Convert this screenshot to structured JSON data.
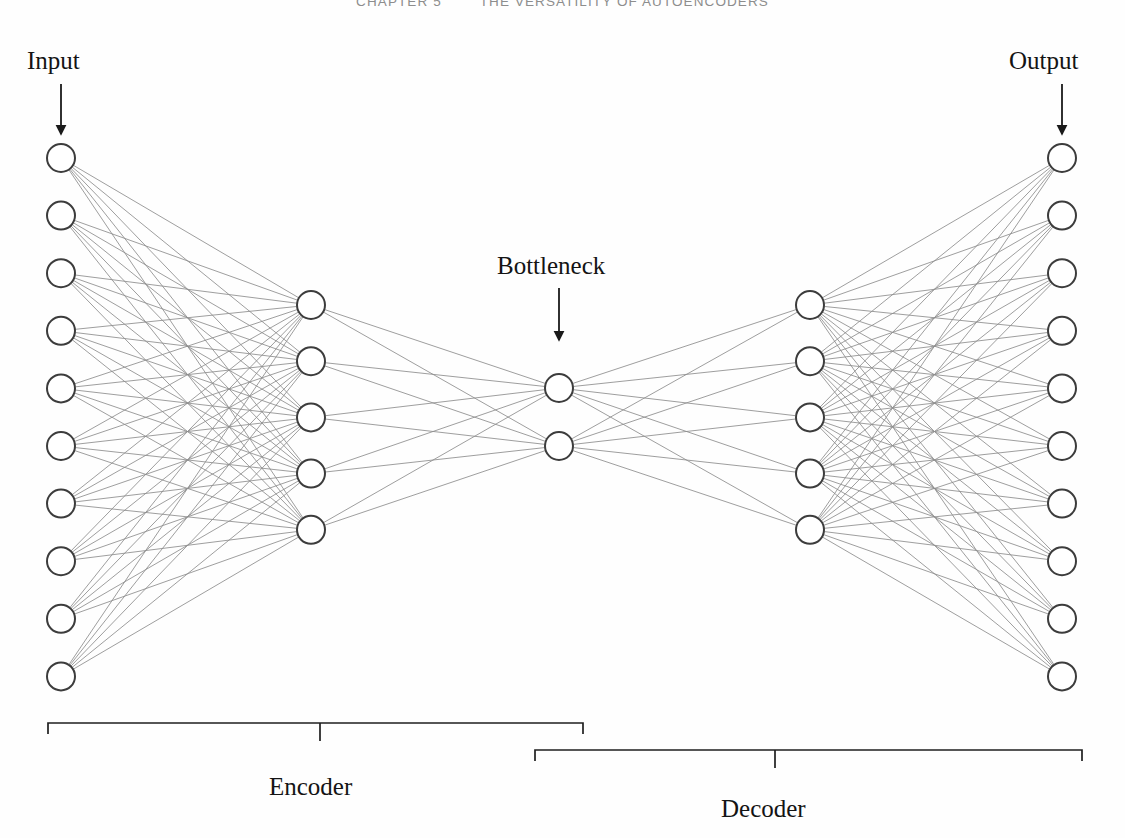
{
  "header": {
    "chapter": "CHAPTER 5",
    "title": "THE VERSATILITY OF AUTOENCODERS"
  },
  "labels": {
    "input": "Input",
    "output": "Output",
    "bottleneck": "Bottleneck",
    "encoder": "Encoder",
    "decoder": "Decoder"
  },
  "colors": {
    "node_stroke": "#3c3c3c",
    "node_fill": "#ffffff",
    "edge": "#8c8c8c",
    "text": "#141414",
    "header_text": "#8d8d8d",
    "brace": "#1f1f1f",
    "arrow": "#1a1a1a"
  },
  "diagram": {
    "type": "neural-network",
    "node_radius": 14,
    "layers": [
      {
        "name": "input-layer",
        "role": "input",
        "count": 10,
        "cx": 61,
        "y_start": 158,
        "y_spacing": 57.6
      },
      {
        "name": "encoder-hidden-layer",
        "role": "encoder",
        "count": 5,
        "cx": 311,
        "y_start": 305,
        "y_spacing": 56.2
      },
      {
        "name": "bottleneck-layer",
        "role": "bottleneck",
        "count": 2,
        "cx": 559,
        "y_start": 388,
        "y_spacing": 58
      },
      {
        "name": "decoder-hidden-layer",
        "role": "decoder",
        "count": 5,
        "cx": 810,
        "y_start": 305,
        "y_spacing": 56.2
      },
      {
        "name": "output-layer",
        "role": "output",
        "count": 10,
        "cx": 1062,
        "y_start": 158,
        "y_spacing": 57.6
      }
    ],
    "connections": [
      {
        "from": "input-layer",
        "to": "encoder-hidden-layer"
      },
      {
        "from": "encoder-hidden-layer",
        "to": "bottleneck-layer"
      },
      {
        "from": "bottleneck-layer",
        "to": "decoder-hidden-layer"
      },
      {
        "from": "decoder-hidden-layer",
        "to": "output-layer"
      }
    ],
    "arrows": [
      {
        "name": "input-arrow",
        "x": 61,
        "y_from": 84,
        "y_to": 134
      },
      {
        "name": "output-arrow",
        "x": 1062,
        "y_from": 84,
        "y_to": 134
      },
      {
        "name": "bottleneck-arrow",
        "x": 559,
        "y_from": 288,
        "y_to": 340
      }
    ],
    "braces": [
      {
        "name": "encoder-brace",
        "x_left": 48,
        "x_right": 583,
        "y": 723,
        "tick_x": 320,
        "tick_len": 18,
        "cap_len": 11
      },
      {
        "name": "decoder-brace",
        "x_left": 535,
        "x_right": 1082,
        "y": 750,
        "tick_x": 775,
        "tick_len": 18,
        "cap_len": 11
      }
    ]
  }
}
